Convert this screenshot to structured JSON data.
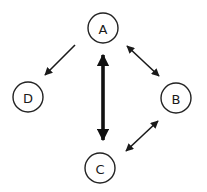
{
  "diagram": {
    "type": "directed-graph",
    "background": "#ffffff",
    "nodes": [
      {
        "id": "A",
        "label": "A",
        "cx": 103,
        "cy": 28,
        "r": 15
      },
      {
        "id": "B",
        "label": "B",
        "cx": 176,
        "cy": 98,
        "r": 15
      },
      {
        "id": "C",
        "label": "C",
        "cx": 100,
        "cy": 168,
        "r": 15
      },
      {
        "id": "D",
        "label": "D",
        "cx": 28,
        "cy": 97,
        "r": 15
      }
    ],
    "edges": [
      {
        "from": "A",
        "to": "D",
        "direction": "one-way",
        "weight": "thin"
      },
      {
        "from": "A",
        "to": "B",
        "direction": "bidirectional",
        "weight": "thin"
      },
      {
        "from": "A",
        "to": "C",
        "direction": "bidirectional",
        "weight": "thick"
      },
      {
        "from": "C",
        "to": "B",
        "direction": "bidirectional",
        "weight": "thin"
      }
    ]
  }
}
